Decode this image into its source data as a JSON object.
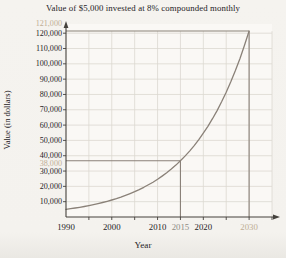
{
  "figure": {
    "title": "Value of $5,000 invested at 8% compounded monthly",
    "x_axis_title": "Year",
    "y_axis_title": "Value (in dollars)"
  },
  "chart_data": {
    "type": "line",
    "title": "Value of $5,000 invested at 8% compounded monthly",
    "xlabel": "Year",
    "ylabel": "Value (in dollars)",
    "xlim": [
      1990,
      2035
    ],
    "ylim": [
      0,
      126000
    ],
    "grid": true,
    "legend": false,
    "x_gridlines": [
      1995,
      2000,
      2005,
      2010,
      2015,
      2020,
      2025,
      2030,
      2035
    ],
    "y_gridlines": [
      10000,
      20000,
      30000,
      40000,
      50000,
      60000,
      70000,
      80000,
      90000,
      100000,
      110000,
      120000
    ],
    "x_ticks": [
      {
        "value": 1990,
        "label": "1990",
        "style": "normal"
      },
      {
        "value": 2000,
        "label": "2000",
        "style": "normal"
      },
      {
        "value": 2010,
        "label": "2010",
        "style": "normal"
      },
      {
        "value": 2015,
        "label": "2015",
        "style": "gray"
      },
      {
        "value": 2020,
        "label": "2020",
        "style": "normal"
      },
      {
        "value": 2030,
        "label": "2030",
        "style": "tan"
      }
    ],
    "y_ticks": [
      {
        "value": 10000,
        "label": "10,000",
        "style": "normal",
        "dy": 0
      },
      {
        "value": 20000,
        "label": "20,000",
        "style": "normal",
        "dy": 0
      },
      {
        "value": 30000,
        "label": "30,000",
        "style": "normal",
        "dy": 0
      },
      {
        "value": 38000,
        "label": "38,000",
        "style": "tan",
        "dy": 5
      },
      {
        "value": 40000,
        "label": "40,000",
        "style": "normal",
        "dy": 0
      },
      {
        "value": 50000,
        "label": "50,000",
        "style": "normal",
        "dy": 0
      },
      {
        "value": 60000,
        "label": "60,000",
        "style": "normal",
        "dy": 0
      },
      {
        "value": 70000,
        "label": "70,000",
        "style": "normal",
        "dy": 0
      },
      {
        "value": 80000,
        "label": "80,000",
        "style": "normal",
        "dy": 0
      },
      {
        "value": 90000,
        "label": "90,000",
        "style": "normal",
        "dy": 0
      },
      {
        "value": 100000,
        "label": "100,000",
        "style": "normal",
        "dy": 0
      },
      {
        "value": 110000,
        "label": "110,000",
        "style": "normal",
        "dy": 0
      },
      {
        "value": 120000,
        "label": "120,000",
        "style": "normal",
        "dy": 0
      },
      {
        "value": 121000,
        "label": "121,000",
        "style": "tan",
        "dy": -8
      }
    ],
    "series": [
      {
        "name": "Investment value ($5,000 at 8% compounded monthly)",
        "x": [
          1990,
          1991,
          1992,
          1993,
          1994,
          1995,
          1996,
          1997,
          1998,
          1999,
          2000,
          2001,
          2002,
          2003,
          2004,
          2005,
          2006,
          2007,
          2008,
          2009,
          2010,
          2011,
          2012,
          2013,
          2014,
          2015,
          2016,
          2017,
          2018,
          2019,
          2020,
          2021,
          2022,
          2023,
          2024,
          2025,
          2026,
          2027,
          2028,
          2029,
          2030
        ],
        "y": [
          5000,
          5415,
          5864,
          6351,
          6878,
          7449,
          8068,
          8737,
          9462,
          10248,
          11098,
          12019,
          13017,
          14098,
          15268,
          16535,
          17907,
          19394,
          21004,
          22747,
          24635,
          26680,
          28894,
          31293,
          33890,
          36703,
          39750,
          43050,
          46624,
          50495,
          54687,
          59227,
          64143,
          69468,
          75235,
          81481,
          88245,
          95571,
          103505,
          112098,
          121403
        ]
      }
    ],
    "annotations": [
      {
        "type": "guide-lines",
        "x": 2015,
        "y": 36703,
        "x_label": "2015",
        "y_label": "38,000"
      },
      {
        "type": "guide-lines",
        "x": 2030,
        "y": 121403,
        "x_label": "2030",
        "y_label": "121,000"
      }
    ],
    "colors": {
      "curve": "#8a8178",
      "guide": "#8a8178",
      "grid": "#dcd8d1",
      "axis": "#44413c",
      "text": "#26231f",
      "tan": "#c0ae94",
      "gray": "#8f8c85",
      "background": "#f4f2ee",
      "plot_background": "#faf8f5"
    }
  }
}
